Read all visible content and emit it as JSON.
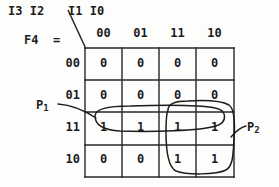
{
  "figure": {
    "type": "karnaugh-map",
    "function_label": "F4  =",
    "row_variables": "I3 I2",
    "col_variables": "I1 I0",
    "separator_glyph": "\\"
  },
  "kmap": {
    "col_headers": [
      "00",
      "01",
      "11",
      "10"
    ],
    "row_headers": [
      "00",
      "01",
      "11",
      "10"
    ],
    "rows": [
      [
        "0",
        "0",
        "0",
        "0"
      ],
      [
        "0",
        "0",
        "0",
        "0"
      ],
      [
        "1",
        "1",
        "1",
        "1"
      ],
      [
        "0",
        "0",
        "1",
        "1"
      ]
    ]
  },
  "groups": [
    {
      "name": "P1",
      "label_text": "P",
      "label_sub": "1",
      "shape": "oval",
      "covers_rows": [
        "11"
      ],
      "covers_cols": [
        "00",
        "01",
        "11",
        "10"
      ]
    },
    {
      "name": "P2",
      "label_text": "P",
      "label_sub": "2",
      "shape": "rounded-rect",
      "covers_rows": [
        "11",
        "10"
      ],
      "covers_cols": [
        "11",
        "10"
      ]
    }
  ],
  "colors": {
    "background": "#fdfdfc",
    "ink": "#1c1c1c",
    "grid": "#262626"
  }
}
